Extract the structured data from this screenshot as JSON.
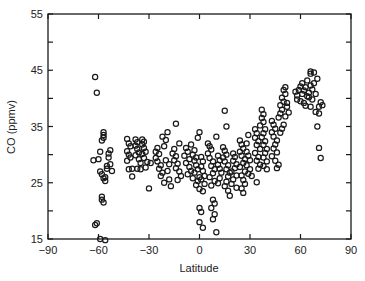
{
  "chart_data": {
    "type": "scatter",
    "title": "",
    "xlabel": "Latitude",
    "ylabel": "CO (ppmv)",
    "xlim": [
      -90,
      90
    ],
    "ylim": [
      15,
      55
    ],
    "xticks": [
      -90,
      -60,
      -30,
      0,
      30,
      60,
      90
    ],
    "xtick_labels": [
      "−90",
      "−60",
      "−30",
      "0",
      "30",
      "60",
      "90"
    ],
    "yticks": [
      15,
      25,
      35,
      45,
      55
    ],
    "ytick_labels": [
      "15",
      "25",
      "35",
      "45",
      "55"
    ],
    "yminor_ticks": [
      20,
      30,
      40,
      50
    ],
    "grid": false,
    "legend": null,
    "marker": "open-circle",
    "marker_color": "#1a1a1a",
    "series": [
      {
        "name": "CO",
        "points": [
          [
            -63,
            29
          ],
          [
            -62,
            43.8
          ],
          [
            -61,
            41
          ],
          [
            -62,
            17.5
          ],
          [
            -61,
            17.8
          ],
          [
            -60,
            29.2
          ],
          [
            -59,
            30.5
          ],
          [
            -59,
            27
          ],
          [
            -58,
            22.5
          ],
          [
            -58,
            22
          ],
          [
            -57,
            21.5
          ],
          [
            -58,
            32.5
          ],
          [
            -57,
            33.5
          ],
          [
            -57,
            34
          ],
          [
            -57,
            33
          ],
          [
            -56,
            26
          ],
          [
            -57,
            25.8
          ],
          [
            -56,
            25.3
          ],
          [
            -58,
            26.5
          ],
          [
            -55,
            28
          ],
          [
            -55,
            27.5
          ],
          [
            -54,
            29.5
          ],
          [
            -54,
            30.2
          ],
          [
            -53,
            30.8
          ],
          [
            -53,
            28.3
          ],
          [
            -52,
            27.1
          ],
          [
            -59,
            15
          ],
          [
            -56,
            14.8
          ],
          [
            -43,
            32.8
          ],
          [
            -42,
            32
          ],
          [
            -41,
            31.5
          ],
          [
            -43,
            30.6
          ],
          [
            -42,
            30
          ],
          [
            -41,
            29.5
          ],
          [
            -43,
            28.9
          ],
          [
            -40,
            27.5
          ],
          [
            -42,
            27.4
          ],
          [
            -40,
            26.1
          ],
          [
            -38,
            32.7
          ],
          [
            -37,
            32.2
          ],
          [
            -38,
            31.6
          ],
          [
            -37,
            31
          ],
          [
            -36,
            30.4
          ],
          [
            -38,
            29.9
          ],
          [
            -36,
            29.2
          ],
          [
            -35,
            28.5
          ],
          [
            -37,
            27.5
          ],
          [
            -35,
            27.4
          ],
          [
            -34,
            32.7
          ],
          [
            -33,
            32.3
          ],
          [
            -34,
            31.8
          ],
          [
            -33,
            31.2
          ],
          [
            -32,
            30.5
          ],
          [
            -34,
            30.1
          ],
          [
            -33,
            29.4
          ],
          [
            -31,
            28.7
          ],
          [
            -32,
            27.7
          ],
          [
            -30,
            24
          ],
          [
            -29,
            28.5
          ],
          [
            -26,
            30.5
          ],
          [
            -25,
            31.2
          ],
          [
            -24,
            30.1
          ],
          [
            -26,
            29.4
          ],
          [
            -25,
            28.8
          ],
          [
            -23,
            28.1
          ],
          [
            -24,
            27.5
          ],
          [
            -22,
            26.8
          ],
          [
            -23,
            26.2
          ],
          [
            -21,
            31.5
          ],
          [
            -20,
            32.6
          ],
          [
            -22,
            33.2
          ],
          [
            -19,
            34
          ],
          [
            -20,
            29
          ],
          [
            -18,
            28.3
          ],
          [
            -19,
            27.1
          ],
          [
            -18,
            25.6
          ],
          [
            -21,
            25
          ],
          [
            -17,
            24.4
          ],
          [
            -16,
            30.2
          ],
          [
            -15,
            31
          ],
          [
            -14,
            29.7
          ],
          [
            -15,
            29
          ],
          [
            -13,
            28.4
          ],
          [
            -14,
            27.6
          ],
          [
            -12,
            27
          ],
          [
            -11,
            26.2
          ],
          [
            -13,
            25.5
          ],
          [
            -14,
            35.5
          ],
          [
            -12,
            32
          ],
          [
            -8,
            31.2
          ],
          [
            -7,
            30.5
          ],
          [
            -9,
            29.8
          ],
          [
            -6,
            29.2
          ],
          [
            -8,
            28.5
          ],
          [
            -6,
            27.8
          ],
          [
            -5,
            27.1
          ],
          [
            -7,
            26.5
          ],
          [
            -4,
            25.8
          ],
          [
            -5,
            31.8
          ],
          [
            -3,
            30.8
          ],
          [
            -4,
            30
          ],
          [
            -2,
            29.5
          ],
          [
            -3,
            28.9
          ],
          [
            -2,
            28.1
          ],
          [
            -1,
            27.4
          ],
          [
            -3,
            26.8
          ],
          [
            0,
            26
          ],
          [
            -1,
            25.3
          ],
          [
            -2,
            24.6
          ],
          [
            0,
            23.9
          ],
          [
            -1,
            33
          ],
          [
            0,
            34
          ],
          [
            1,
            29.6
          ],
          [
            2,
            28.8
          ],
          [
            1,
            27.9
          ],
          [
            2,
            27.1
          ],
          [
            3,
            26.2
          ],
          [
            1,
            25.6
          ],
          [
            3,
            24.8
          ],
          [
            2,
            23.5
          ],
          [
            0,
            20.5
          ],
          [
            1,
            19.8
          ],
          [
            0,
            18
          ],
          [
            2,
            17
          ],
          [
            5,
            32
          ],
          [
            6,
            31.5
          ],
          [
            7,
            30.9
          ],
          [
            5,
            30.2
          ],
          [
            6,
            29.4
          ],
          [
            8,
            28.8
          ],
          [
            7,
            28
          ],
          [
            9,
            27.4
          ],
          [
            8,
            26.7
          ],
          [
            6,
            26
          ],
          [
            9,
            25.3
          ],
          [
            7,
            24.5
          ],
          [
            8,
            22
          ],
          [
            9,
            21.3
          ],
          [
            7,
            20.5
          ],
          [
            9,
            19.4
          ],
          [
            8,
            18.5
          ],
          [
            10,
            16.2
          ],
          [
            10,
            33.2
          ],
          [
            11,
            29.8
          ],
          [
            12,
            29
          ],
          [
            11,
            28.2
          ],
          [
            12,
            27.5
          ],
          [
            13,
            26.8
          ],
          [
            12,
            25.8
          ],
          [
            11,
            24.9
          ],
          [
            14,
            31.3
          ],
          [
            15,
            30.7
          ],
          [
            16,
            30
          ],
          [
            14,
            29.5
          ],
          [
            15,
            28.8
          ],
          [
            17,
            28.1
          ],
          [
            16,
            27.4
          ],
          [
            18,
            26.8
          ],
          [
            17,
            26.1
          ],
          [
            16,
            25.2
          ],
          [
            15,
            24.4
          ],
          [
            17,
            23.6
          ],
          [
            18,
            22.7
          ],
          [
            15,
            37.8
          ],
          [
            16,
            35
          ],
          [
            20,
            30.2
          ],
          [
            21,
            29.6
          ],
          [
            20,
            28.9
          ],
          [
            22,
            28.3
          ],
          [
            21,
            27.6
          ],
          [
            19,
            27
          ],
          [
            22,
            26.3
          ],
          [
            20,
            25.6
          ],
          [
            19,
            24.8
          ],
          [
            22,
            24.1
          ],
          [
            24,
            32.5
          ],
          [
            25,
            31.8
          ],
          [
            26,
            31.1
          ],
          [
            24,
            30.5
          ],
          [
            25,
            29.8
          ],
          [
            27,
            29.2
          ],
          [
            26,
            28.5
          ],
          [
            24,
            27.8
          ],
          [
            27,
            27
          ],
          [
            25,
            26.3
          ],
          [
            26,
            25.5
          ],
          [
            27,
            24.8
          ],
          [
            25,
            24
          ],
          [
            26,
            23.2
          ],
          [
            28,
            32
          ],
          [
            29,
            33.5
          ],
          [
            28,
            30.5
          ],
          [
            29,
            29.8
          ],
          [
            30,
            29
          ],
          [
            28,
            28.1
          ],
          [
            30,
            27.4
          ],
          [
            29,
            26.6
          ],
          [
            31,
            26.2
          ],
          [
            33,
            34.5
          ],
          [
            34,
            33.8
          ],
          [
            33,
            33
          ],
          [
            35,
            32.4
          ],
          [
            34,
            31.7
          ],
          [
            36,
            31
          ],
          [
            33,
            30.3
          ],
          [
            35,
            29.6
          ],
          [
            34,
            28.9
          ],
          [
            36,
            28.2
          ],
          [
            35,
            27.5
          ],
          [
            34,
            25.1
          ],
          [
            37,
            38
          ],
          [
            38,
            37.2
          ],
          [
            37,
            36.5
          ],
          [
            38,
            35.8
          ],
          [
            36,
            35.2
          ],
          [
            39,
            34.5
          ],
          [
            38,
            33.8
          ],
          [
            37,
            33.1
          ],
          [
            39,
            32.4
          ],
          [
            38,
            31.7
          ],
          [
            40,
            31
          ],
          [
            39,
            30.3
          ],
          [
            38,
            29.5
          ],
          [
            40,
            28.8
          ],
          [
            38,
            28
          ],
          [
            40,
            27.4
          ],
          [
            43,
            36
          ],
          [
            44,
            35.3
          ],
          [
            45,
            34.6
          ],
          [
            43,
            34
          ],
          [
            44,
            33.2
          ],
          [
            46,
            32.5
          ],
          [
            45,
            31.8
          ],
          [
            44,
            31.1
          ],
          [
            46,
            30.4
          ],
          [
            43,
            29.7
          ],
          [
            45,
            28.9
          ],
          [
            47,
            28.2
          ],
          [
            46,
            27.6
          ],
          [
            47,
            36.6
          ],
          [
            48,
            37.3
          ],
          [
            49,
            38
          ],
          [
            48,
            38.8
          ],
          [
            50,
            39.4
          ],
          [
            49,
            40.1
          ],
          [
            51,
            40.8
          ],
          [
            50,
            41.5
          ],
          [
            51,
            42
          ],
          [
            52,
            39.2
          ],
          [
            52,
            38.5
          ],
          [
            53,
            37.5
          ],
          [
            51,
            36.8
          ],
          [
            50,
            35.3
          ],
          [
            49,
            34.6
          ],
          [
            48,
            33.9
          ],
          [
            58,
            40.5
          ],
          [
            59,
            41.5
          ],
          [
            60,
            42.1
          ],
          [
            58,
            39.8
          ],
          [
            60,
            39.5
          ],
          [
            61,
            40.8
          ],
          [
            62,
            41.4
          ],
          [
            61,
            42.7
          ],
          [
            63,
            42
          ],
          [
            62,
            39.2
          ],
          [
            64,
            40.4
          ],
          [
            63,
            38.7
          ],
          [
            65,
            41
          ],
          [
            64,
            43.2
          ],
          [
            66,
            42.3
          ],
          [
            65,
            40.2
          ],
          [
            67,
            41.6
          ],
          [
            66,
            38.5
          ],
          [
            68,
            42.7
          ],
          [
            67,
            39.8
          ],
          [
            69,
            40.8
          ],
          [
            68,
            44.6
          ],
          [
            70,
            43.5
          ],
          [
            69,
            37.6
          ],
          [
            71,
            38.5
          ],
          [
            72,
            39.3
          ],
          [
            73,
            38.8
          ],
          [
            71,
            37.3
          ],
          [
            70,
            35
          ],
          [
            71,
            31.2
          ],
          [
            72,
            29.4
          ],
          [
            66,
            44.8
          ],
          [
            66,
            44.4
          ],
          [
            57,
            41.2
          ]
        ]
      }
    ]
  }
}
